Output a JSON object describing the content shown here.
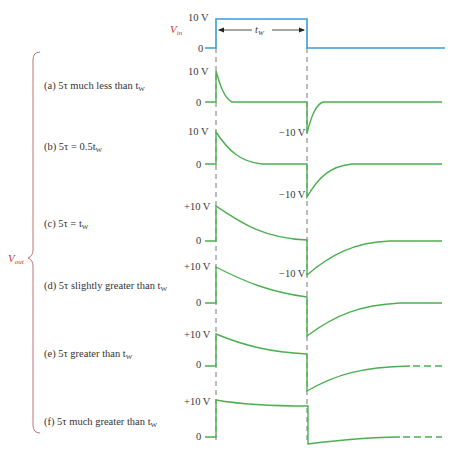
{
  "input": {
    "label": "V",
    "label_sub": "in",
    "high_label": "10 V",
    "low_label": "0",
    "width_label": "t",
    "width_sub": "W",
    "color": "#3a9ad9"
  },
  "output": {
    "label": "V",
    "label_sub": "out",
    "color": "#4caf50",
    "bracket_color": "#b05050"
  },
  "cases": [
    {
      "id": "a",
      "text": "(a) 5τ much less than t",
      "sub": "W",
      "peak_label": "10 V",
      "zero_label": "0",
      "neg_label": "−10 V"
    },
    {
      "id": "b",
      "text": "(b) 5τ  =  0.5t",
      "sub": "W",
      "peak_label": "10 V",
      "zero_label": "0",
      "neg_label": "−10 V"
    },
    {
      "id": "c",
      "text": "(c) 5τ  =   t",
      "sub": "W",
      "peak_label": "+10 V",
      "zero_label": "0",
      "neg_label": "−10 V"
    },
    {
      "id": "d",
      "text": "(d) 5τ slightly greater than t",
      "sub": "W",
      "peak_label": "+10 V",
      "zero_label": "0",
      "neg_label": ""
    },
    {
      "id": "e",
      "text": "(e) 5τ greater than t",
      "sub": "W",
      "peak_label": "+10 V",
      "zero_label": "0",
      "neg_label": ""
    },
    {
      "id": "f",
      "text": "(f) 5τ much greater than t",
      "sub": "W",
      "peak_label": "+10 V",
      "zero_label": "0",
      "neg_label": ""
    }
  ]
}
